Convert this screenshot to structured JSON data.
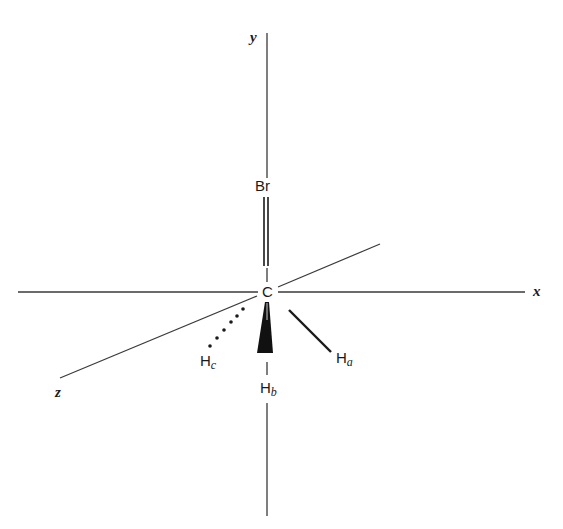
{
  "diagram": {
    "type": "molecular-3d-coordinate-diagram",
    "colors": {
      "line": "#3a3a3a",
      "text": "#1a1a1a",
      "background": "#ffffff"
    },
    "axes": {
      "x": {
        "label": "x"
      },
      "y": {
        "label": "y"
      },
      "z": {
        "label": "z"
      }
    },
    "atoms": {
      "central": {
        "symbol": "C"
      },
      "bromine": {
        "symbol": "Br",
        "bond": "double-line (in plane, along y axis)"
      },
      "hydrogens": [
        {
          "symbol": "H",
          "subscript": "a",
          "bond": "solid line"
        },
        {
          "symbol": "H",
          "subscript": "b",
          "bond": "solid wedge"
        },
        {
          "symbol": "H",
          "subscript": "c",
          "bond": "dotted line"
        }
      ]
    }
  }
}
